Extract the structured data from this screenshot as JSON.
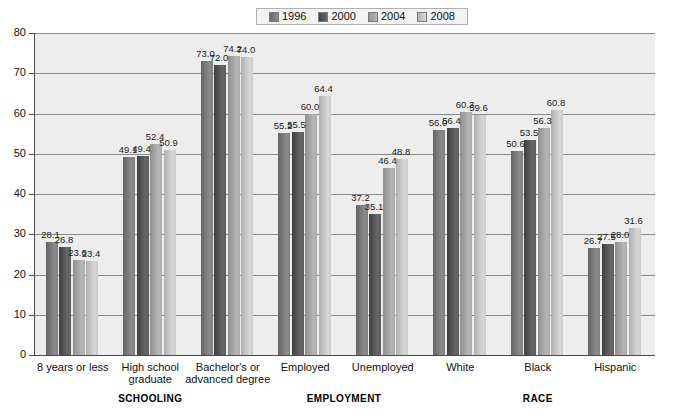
{
  "legend": {
    "items": [
      {
        "label": "1996",
        "color": "#7d7d7d"
      },
      {
        "label": "2000",
        "color": "#595959"
      },
      {
        "label": "2004",
        "color": "#a8a8a8"
      },
      {
        "label": "2008",
        "color": "#c9c9c9"
      }
    ]
  },
  "axis": {
    "y_ticks": [
      "0",
      "10",
      "20",
      "30",
      "40",
      "50",
      "60",
      "70",
      "80"
    ]
  },
  "sections": [
    {
      "label": "SCHOOLING"
    },
    {
      "label": "EMPLOYMENT"
    },
    {
      "label": "RACE"
    }
  ],
  "chart_data": {
    "type": "bar",
    "title": "",
    "xlabel": "",
    "ylabel": "",
    "ylim": [
      0,
      80
    ],
    "ytick_step": 10,
    "grid": true,
    "legend_position": "top-center",
    "categories": [
      "8 years or less",
      "High school graduate",
      "Bachelor's or advanced degree",
      "Employed",
      "Unemployed",
      "White",
      "Black",
      "Hispanic"
    ],
    "category_lines": [
      [
        "8 years or less"
      ],
      [
        "High school",
        "graduate"
      ],
      [
        "Bachelor's or",
        "advanced degree"
      ],
      [
        "Employed"
      ],
      [
        "Unemployed"
      ],
      [
        "White"
      ],
      [
        "Black"
      ],
      [
        "Hispanic"
      ]
    ],
    "category_sections": [
      "SCHOOLING",
      "SCHOOLING",
      "SCHOOLING",
      "EMPLOYMENT",
      "EMPLOYMENT",
      "RACE",
      "RACE",
      "RACE"
    ],
    "series": [
      {
        "name": "1996",
        "color": "#7d7d7d",
        "values": [
          28.1,
          49.1,
          73.0,
          55.2,
          37.2,
          56.0,
          50.6,
          26.7
        ]
      },
      {
        "name": "2000",
        "color": "#595959",
        "values": [
          26.8,
          49.4,
          72.0,
          55.5,
          35.1,
          56.4,
          53.5,
          27.5
        ]
      },
      {
        "name": "2004",
        "color": "#a8a8a8",
        "values": [
          23.6,
          52.4,
          74.2,
          60.0,
          46.4,
          60.3,
          56.3,
          28.0
        ]
      },
      {
        "name": "2008",
        "color": "#c9c9c9",
        "values": [
          23.4,
          50.9,
          74.0,
          64.4,
          48.8,
          59.6,
          60.8,
          31.6
        ]
      }
    ]
  }
}
